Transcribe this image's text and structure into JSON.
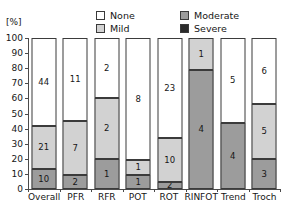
{
  "axis": {
    "unit_label": "[%]",
    "y_ticks": [
      0,
      10,
      20,
      30,
      40,
      50,
      60,
      70,
      80,
      90,
      100
    ]
  },
  "legend": {
    "items": [
      {
        "label": "None",
        "color": "#ffffff",
        "key": "none"
      },
      {
        "label": "Moderate",
        "color": "#9c9c9c",
        "key": "moderate"
      },
      {
        "label": "Mild",
        "color": "#d2d2d2",
        "key": "mild"
      },
      {
        "label": "Severe",
        "color": "#2b2b2b",
        "key": "severe"
      }
    ]
  },
  "chart_data": {
    "type": "bar",
    "stacked": true,
    "normalized": true,
    "title": "",
    "xlabel": "",
    "ylabel": "[%]",
    "ylim": [
      0,
      100
    ],
    "ytick_step": 10,
    "grid": false,
    "legend_position": "top",
    "categories": [
      "Overall",
      "PFR",
      "RFR",
      "POT",
      "ROT",
      "RINFOT",
      "Trend",
      "Troch"
    ],
    "series": [
      {
        "name": "Severe",
        "color": "#2b2b2b",
        "counts": [
          0,
          0,
          0,
          0,
          0,
          0,
          0,
          0
        ],
        "percents": [
          0,
          0,
          0,
          0,
          0,
          0,
          0,
          0
        ]
      },
      {
        "name": "Moderate",
        "color": "#9c9c9c",
        "counts": [
          10,
          2,
          1,
          1,
          2,
          4,
          4,
          3
        ],
        "percents": [
          13.3,
          9.5,
          20.0,
          9.5,
          4.8,
          79.0,
          44.0,
          20.0
        ]
      },
      {
        "name": "Mild",
        "color": "#d2d2d2",
        "counts": [
          21,
          7,
          2,
          1,
          10,
          1,
          0,
          5
        ],
        "percents": [
          28.2,
          35.5,
          40.0,
          10.0,
          28.7,
          21.0,
          0,
          36.0
        ]
      },
      {
        "name": "None",
        "color": "#ffffff",
        "counts": [
          44,
          11,
          2,
          8,
          23,
          0,
          5,
          6
        ],
        "percents": [
          58.5,
          55.0,
          40.0,
          80.5,
          66.5,
          0,
          56.0,
          44.0
        ]
      }
    ]
  }
}
